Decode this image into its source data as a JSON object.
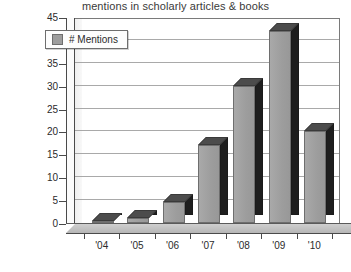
{
  "chart_data": {
    "type": "bar",
    "title": "mentions in scholarly articles & books",
    "xlabel": "",
    "ylabel": "",
    "categories": [
      "'04",
      "'05",
      "'06",
      "'07",
      "'08",
      "'09",
      "'10"
    ],
    "values": [
      0.3,
      1,
      4.5,
      17,
      30,
      42,
      20
    ],
    "series": [
      {
        "name": "# Mentions",
        "values": [
          0.3,
          1,
          4.5,
          17,
          30,
          42,
          20
        ]
      }
    ],
    "ylim": [
      0,
      45
    ],
    "ytick_step": 5,
    "ytick_labels": [
      "0",
      "5",
      "10",
      "15",
      "20",
      "25",
      "30",
      "35",
      "40",
      "45"
    ],
    "grid": true,
    "legend_position": "top-left",
    "style": "3d-column",
    "colors": {
      "bar_front": "#9d9d9d",
      "bar_side": "#1e1e1e",
      "bar_top": "#4c4c4c",
      "gridline": "#9a9a9a",
      "frame": "#7a7a7a",
      "text": "#2b2b2b",
      "background": "#ffffff"
    }
  },
  "legend": {
    "entries": [
      {
        "label": "# Mentions",
        "swatch_color": "#9d9d9d"
      }
    ]
  }
}
